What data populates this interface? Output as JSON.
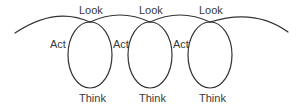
{
  "diagram": {
    "type": "cycle-loops",
    "stroke_color": "#333333",
    "text_color": "#3a3a3a",
    "loops": [
      {
        "look": "Look",
        "act": "Act",
        "think": "Think"
      },
      {
        "look": "Look",
        "act": "Act",
        "think": "Think"
      },
      {
        "look": "Look",
        "act": "Act",
        "think": "Think"
      }
    ]
  }
}
